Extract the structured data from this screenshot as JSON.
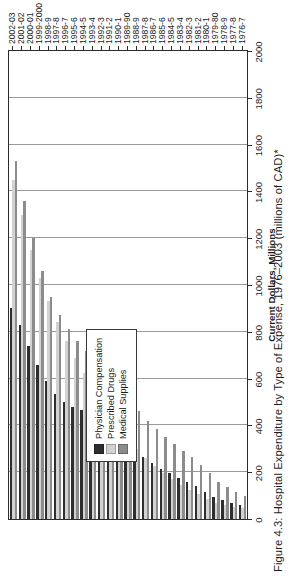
{
  "figure": {
    "title": "Figure 4.3: Hospital Expenditure by Type of Expense, 1976–2003 (millions of CAD)*"
  },
  "legend": {
    "position": "inside-left",
    "items": [
      {
        "label": "Physician Compensation",
        "color": "#2e2e2e",
        "key": "physician"
      },
      {
        "label": "Prescribed Drugs",
        "color": "#d2d2d2",
        "key": "drugs"
      },
      {
        "label": "Medical Supplies",
        "color": "#8c8c8c",
        "key": "supplies"
      }
    ]
  },
  "axes": {
    "value_axis_title": "Current Dollars, Millions",
    "value_ticks": [
      "0",
      "200",
      "400",
      "600",
      "800",
      "1000",
      "1200",
      "1400",
      "1600",
      "1800",
      "2000"
    ],
    "category_axis_title": ""
  },
  "chart_data": {
    "type": "bar",
    "orientation": "horizontal",
    "title": "Figure 4.3: Hospital Expenditure by Type of Expense, 1976–2003 (millions of CAD)*",
    "xlabel": "Current Dollars, Millions",
    "ylabel": "",
    "xlim": [
      0,
      2000
    ],
    "xticks": [
      0,
      200,
      400,
      600,
      800,
      1000,
      1200,
      1400,
      1600,
      1800,
      2000
    ],
    "grid": true,
    "legend_position": "inside-left",
    "categories": [
      "1976-7",
      "1977-8",
      "1978-9",
      "1979-80",
      "1980-1",
      "1981-2",
      "1982-3",
      "1983-4",
      "1984-5",
      "1985-6",
      "1986-7",
      "1987-8",
      "1988-9",
      "1989-90",
      "1990-1",
      "1991-2",
      "1992-3",
      "1993-4",
      "1994-5",
      "1995-6",
      "1996-7",
      "1997-8",
      "1998-9",
      "1999-2000",
      "2000-01",
      "2001-02",
      "2002-03"
    ],
    "series": [
      {
        "name": "Physician Compensation",
        "color": "#2e2e2e",
        "values": [
          60,
          70,
          80,
          95,
          115,
          140,
          160,
          175,
          195,
          215,
          240,
          265,
          295,
          330,
          370,
          405,
          430,
          450,
          465,
          480,
          500,
          535,
          590,
          660,
          740,
          830,
          900
        ]
      },
      {
        "name": "Prescribed Drugs",
        "color": "#d2d2d2",
        "values": [
          45,
          50,
          60,
          70,
          85,
          105,
          125,
          145,
          170,
          195,
          225,
          260,
          300,
          345,
          395,
          450,
          505,
          565,
          625,
          690,
          760,
          840,
          930,
          1030,
          1150,
          1300,
          1450
        ]
      },
      {
        "name": "Medical Supplies",
        "color": "#8c8c8c",
        "values": [
          100,
          115,
          135,
          160,
          195,
          230,
          265,
          290,
          320,
          350,
          385,
          420,
          460,
          505,
          555,
          600,
          640,
          680,
          720,
          760,
          810,
          870,
          950,
          1060,
          1200,
          1360,
          1530
        ]
      }
    ]
  }
}
